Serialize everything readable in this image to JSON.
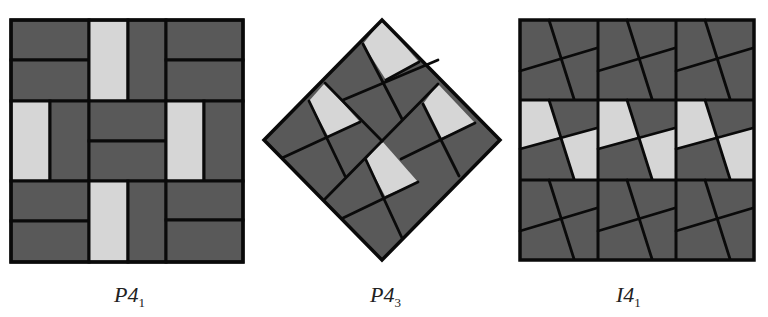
{
  "figure": {
    "colors": {
      "dark": "#595959",
      "light": "#d6d6d6",
      "line": "#0a0a0a",
      "background": "#ffffff"
    },
    "panels": [
      {
        "id": "p41",
        "label_main": "P4",
        "label_sub": "1",
        "shape": "square-3x3-bricks"
      },
      {
        "id": "p43",
        "label_main": "P4",
        "label_sub": "3",
        "shape": "diamond-pinwheel"
      },
      {
        "id": "i41",
        "label_main": "I4",
        "label_sub": "1",
        "shape": "square-3x3-pinwheels"
      }
    ]
  }
}
